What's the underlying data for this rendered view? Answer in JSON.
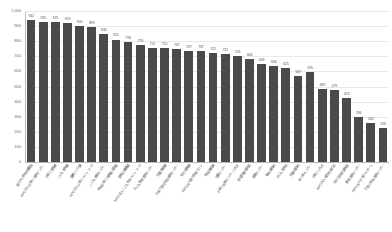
{
  "chart_data": {
    "type": "bar",
    "title": "",
    "subtitle": "",
    "xlabel": "",
    "ylabel": "",
    "ylim": [
      0,
      1000
    ],
    "ytick_labels": [
      "1,000",
      "900",
      "800",
      "700",
      "600",
      "500",
      "400",
      "300",
      "200",
      "100",
      "0"
    ],
    "ytick_values": [
      1000,
      900,
      800,
      700,
      600,
      500,
      400,
      300,
      200,
      100,
      0
    ],
    "grid": true,
    "legend": "none",
    "bar_color": "#4a4a4a",
    "categories": [
      "富士市立中央図書館",
      "NPO法人子育て支援センター",
      "子育て支援課",
      "こども未来課",
      "健康づくり課",
      "NPO法人子育てネットワーク",
      "こども家庭センター",
      "地域子育て支援拠点事業",
      "保育幼稚園課",
      "NPO法人こども未来ネットワーク",
      "子ども家庭支援センター",
      "児童家庭課",
      "子育て世代包括支援センター",
      "母子保健課",
      "NPO法人親子支援ネット",
      "地域福祉課",
      "児童センター",
      "子育て支援センターひろば",
      "家庭児童相談室",
      "保健センター",
      "福祉事務所",
      "子ども未来部",
      "児童相談所",
      "青少年センター",
      "子育てひろば",
      "NPO法人育児支援の会",
      "母子生活支援施設",
      "教育支援センター",
      "NPO法人子育てサポート",
      "子育て総合支援センター"
    ],
    "values": [
      942,
      925,
      925,
      919,
      900,
      893,
      846,
      811,
      796,
      776,
      752,
      752,
      747,
      737,
      737,
      722,
      715,
      703,
      684,
      649,
      636,
      625,
      569,
      595,
      483,
      479,
      423,
      296,
      260,
      226
    ]
  }
}
